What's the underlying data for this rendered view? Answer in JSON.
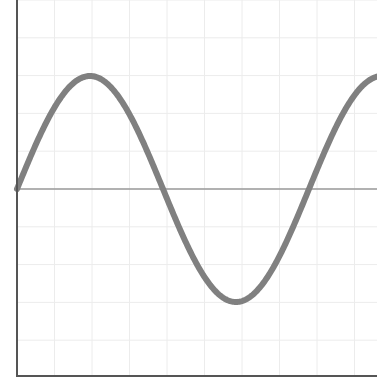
{
  "chart_data": {
    "type": "line",
    "title": "",
    "xlabel": "",
    "ylabel": "",
    "grid": true,
    "legend": null,
    "series": [
      {
        "name": "sine wave",
        "function": "y = sin(x)",
        "x": [
          0,
          0.785,
          1.571,
          2.356,
          3.142,
          3.927,
          4.712,
          5.498,
          6.283,
          7.069
        ],
        "values": [
          0,
          0.707,
          1,
          0.707,
          0,
          -0.707,
          -1,
          -0.707,
          0,
          0.707
        ]
      }
    ],
    "baseline": {
      "y": 0
    },
    "xlim": [
      0,
      7.6
    ],
    "ylim": [
      -1.65,
      1.65
    ],
    "colors": {
      "curve": "#808080",
      "baseline": "#9a9a9a",
      "axis": "#555555",
      "grid": "#ececec"
    }
  }
}
